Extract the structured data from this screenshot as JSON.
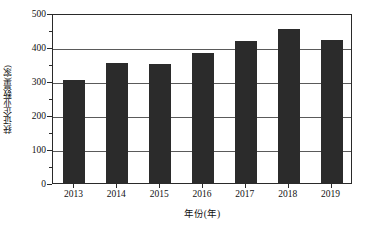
{
  "chart_data": {
    "type": "bar",
    "title": "",
    "subtitle": "",
    "xlabel": "年份(年)",
    "ylabel": "获证企业数量(家)",
    "categories": [
      "2013",
      "2014",
      "2015",
      "2016",
      "2017",
      "2018",
      "2019"
    ],
    "values": [
      303,
      354,
      350,
      383,
      418,
      452,
      421
    ],
    "series": [
      {
        "name": "获证企业数量",
        "values": [
          303,
          354,
          350,
          383,
          418,
          452,
          421
        ]
      }
    ],
    "ylim": [
      0,
      500
    ],
    "ytick_labels": [
      "0",
      "100",
      "200",
      "300",
      "400",
      "500"
    ],
    "ytick_values": [
      0,
      100,
      200,
      300,
      400,
      500
    ],
    "yminor_values": [
      50,
      150,
      250,
      350,
      450
    ],
    "ytick_interval": 100,
    "yminor_interval": 50,
    "grid": "horizontal",
    "legend": "none",
    "bar_color": "#2b2b2b",
    "gridline_color": "#5a5a5a",
    "axis_color": "#2a2a2a",
    "background_color": "#ffffff",
    "annotations": []
  }
}
